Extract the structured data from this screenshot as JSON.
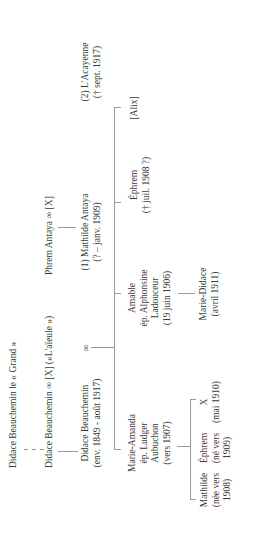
{
  "diagram": {
    "type": "genealogy-tree",
    "orientation": "rotated-90-ccw",
    "generation_1": {
      "ancestor": "Didace Beauchemin le « Grand »"
    },
    "generation_2": {
      "couple_1": "Didace Beauchemin ∞ [X] («L'aïeule »)",
      "couple_2": "Phrem Antaya ∞ [X]"
    },
    "generation_3": {
      "didace": {
        "name": "Didace Beauchemin",
        "dates": "(env. 1849 - août 1917)"
      },
      "marriage_symbol": "∞",
      "mathilde": {
        "name": "(1) Mathilde Antaya",
        "dates": "(? – janv. 1909)"
      },
      "acayenne": {
        "name": "(2) L'Acayenne",
        "dates": "(† sept. 1917)"
      }
    },
    "generation_4": [
      {
        "lines": [
          "Marie-Amanda",
          "ép. Ludger",
          "Aubuchon",
          "(vers 1907)"
        ]
      },
      {
        "lines": [
          "Amable",
          "ép. Alphonsine",
          "Ladouceur",
          "(19 juin 1906)"
        ]
      },
      {
        "lines": [
          "Éphrem",
          "(† juil. 1908 ?)"
        ]
      },
      {
        "lines": [
          "[Alix]"
        ]
      }
    ],
    "generation_5": {
      "marie_didace": {
        "lines": [
          "Marie-Didace",
          "(avril 1911)"
        ]
      },
      "aubuchon_children": [
        {
          "lines": [
            "Mathilde",
            "(née vers",
            "1908)"
          ]
        },
        {
          "lines": [
            "Éphrem",
            "(né vers",
            "1909)"
          ]
        },
        {
          "lines": [
            "X",
            "(mai 1910)"
          ]
        }
      ]
    },
    "colors": {
      "text": "#3a3a3a",
      "lines": "#9a9a9a",
      "background": "#ffffff"
    }
  }
}
